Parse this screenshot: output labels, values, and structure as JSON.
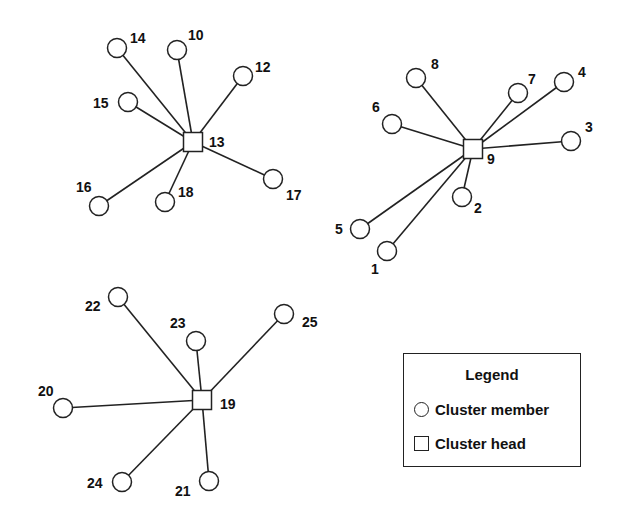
{
  "colors": {
    "stroke": "#222222",
    "background": "#ffffff",
    "text": "#111111"
  },
  "clusters": [
    {
      "head": {
        "id": "13",
        "x": 193,
        "y": 142,
        "label_dx": 16,
        "label_dy": 5
      },
      "members": [
        {
          "id": "14",
          "x": 117,
          "y": 48,
          "lx": 130,
          "ly": 43
        },
        {
          "id": "10",
          "x": 177,
          "y": 50,
          "lx": 188,
          "ly": 40
        },
        {
          "id": "12",
          "x": 243,
          "y": 76,
          "lx": 255,
          "ly": 72
        },
        {
          "id": "15",
          "x": 128,
          "y": 102,
          "lx": 93,
          "ly": 108
        },
        {
          "id": "17",
          "x": 273,
          "y": 179,
          "lx": 286,
          "ly": 200
        },
        {
          "id": "16",
          "x": 99,
          "y": 206,
          "lx": 76,
          "ly": 192
        },
        {
          "id": "18",
          "x": 165,
          "y": 202,
          "lx": 178,
          "ly": 197
        }
      ]
    },
    {
      "head": {
        "id": "9",
        "x": 473,
        "y": 149,
        "label_dx": 14,
        "label_dy": 15
      },
      "members": [
        {
          "id": "8",
          "x": 416,
          "y": 78,
          "lx": 431,
          "ly": 69
        },
        {
          "id": "7",
          "x": 518,
          "y": 93,
          "lx": 528,
          "ly": 84
        },
        {
          "id": "4",
          "x": 564,
          "y": 82,
          "lx": 578,
          "ly": 77
        },
        {
          "id": "6",
          "x": 392,
          "y": 124,
          "lx": 372,
          "ly": 112
        },
        {
          "id": "3",
          "x": 571,
          "y": 141,
          "lx": 585,
          "ly": 132
        },
        {
          "id": "2",
          "x": 462,
          "y": 197,
          "lx": 474,
          "ly": 213
        },
        {
          "id": "5",
          "x": 360,
          "y": 229,
          "lx": 335,
          "ly": 234
        },
        {
          "id": "1",
          "x": 387,
          "y": 251,
          "lx": 371,
          "ly": 274
        }
      ]
    },
    {
      "head": {
        "id": "19",
        "x": 202,
        "y": 400,
        "label_dx": 18,
        "label_dy": 9
      },
      "members": [
        {
          "id": "22",
          "x": 118,
          "y": 297,
          "lx": 85,
          "ly": 311
        },
        {
          "id": "23",
          "x": 196,
          "y": 341,
          "lx": 170,
          "ly": 328
        },
        {
          "id": "25",
          "x": 284,
          "y": 314,
          "lx": 302,
          "ly": 327
        },
        {
          "id": "20",
          "x": 63,
          "y": 408,
          "lx": 38,
          "ly": 396
        },
        {
          "id": "24",
          "x": 122,
          "y": 482,
          "lx": 87,
          "ly": 488
        },
        {
          "id": "21",
          "x": 209,
          "y": 481,
          "lx": 175,
          "ly": 496
        }
      ]
    }
  ],
  "legend": {
    "title": "Legend",
    "items": [
      {
        "symbol": "circle",
        "label": "Cluster member"
      },
      {
        "symbol": "square",
        "label": "Cluster head"
      }
    ]
  }
}
